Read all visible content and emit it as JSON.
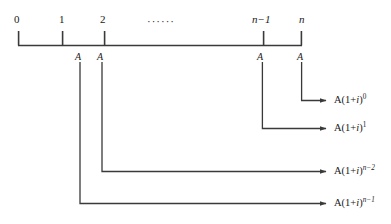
{
  "figure": {
    "timeline": {
      "ticks": [
        {
          "id": "t0",
          "label": "0",
          "x": 18,
          "italic": false
        },
        {
          "id": "t1",
          "label": "1",
          "x": 62,
          "italic": false
        },
        {
          "id": "t2",
          "label": "2",
          "x": 104,
          "italic": false
        },
        {
          "id": "tn1",
          "label": "n−1",
          "x": 262,
          "italic": true
        },
        {
          "id": "tn",
          "label": "n",
          "x": 302,
          "italic": true
        }
      ],
      "ellipsis": "······"
    },
    "payments": [
      {
        "id": "p1",
        "label": "A",
        "x": 78
      },
      {
        "id": "p2",
        "label": "A",
        "x": 100
      },
      {
        "id": "p3",
        "label": "A",
        "x": 259
      },
      {
        "id": "p4",
        "label": "A",
        "x": 299
      }
    ],
    "flows": [
      {
        "id": "f0",
        "from_tick": "n",
        "formula_text": "A(1+i)^0",
        "base": "A(1+",
        "var": "i",
        "close": ")",
        "exponent": "0",
        "exponent_italic": false
      },
      {
        "id": "f1",
        "from_tick": "n-1",
        "formula_text": "A(1+i)^1",
        "base": "A(1+",
        "var": "i",
        "close": ")",
        "exponent": "1",
        "exponent_italic": false
      },
      {
        "id": "f2",
        "from_tick": "2",
        "formula_text": "A(1+i)^(n-2)",
        "base": "A(1+",
        "var": "i",
        "close": ")",
        "exponent": "n−2",
        "exponent_italic": true
      },
      {
        "id": "f3",
        "from_tick": "1",
        "formula_text": "A(1+i)^(n-1)",
        "base": "A(1+",
        "var": "i",
        "close": ")",
        "exponent": "n−1",
        "exponent_italic": true
      }
    ],
    "colors": {
      "line": "#3a3a3a",
      "text": "#1a1a1a",
      "background": "#ffffff"
    }
  }
}
